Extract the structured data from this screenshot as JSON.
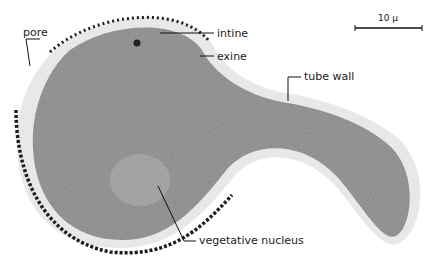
{
  "figure": {
    "labels": {
      "pore": "pore",
      "intine": "intine",
      "exine": "exine",
      "tube_wall": "tube wall",
      "vegetative_nucleus": "vegetative nucleus"
    },
    "scale_bar": {
      "label": "10 µ"
    },
    "colors": {
      "cytoplasm": "#9a9a9a",
      "intine": "#e6e6e6",
      "exine": "#222222",
      "background": "#ffffff"
    }
  }
}
